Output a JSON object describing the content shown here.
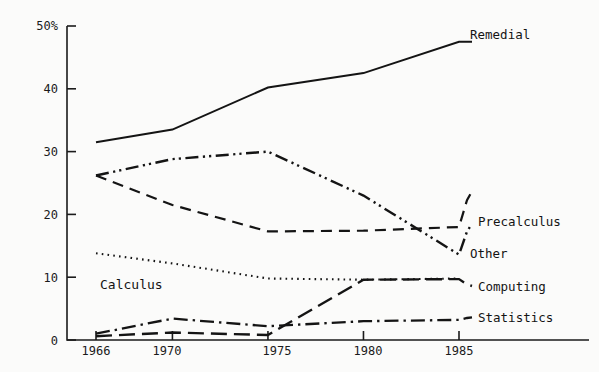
{
  "chart_data": {
    "type": "line",
    "title": "",
    "subtitle": "",
    "xlabel": "",
    "ylabel": "",
    "x": [
      1966,
      1970,
      1975,
      1980,
      1985
    ],
    "xtick_labels": [
      "1966",
      "1970",
      "1975",
      "1980",
      "1985"
    ],
    "ytick_labels": [
      "0",
      "10",
      "20",
      "30",
      "40",
      "50%"
    ],
    "ytick_values": [
      0,
      10,
      20,
      30,
      40,
      50
    ],
    "xlim": [
      1964.5,
      1986.5
    ],
    "ylim": [
      0,
      50
    ],
    "grid": false,
    "legend_position": "right-inline-labels",
    "series": [
      {
        "name": "Remedial",
        "label": "Remedial",
        "style": "solid",
        "values": [
          31.5,
          33.5,
          40.2,
          42.5,
          47.5
        ],
        "label_x": 1986.2,
        "label_y": 47.5
      },
      {
        "name": "Other",
        "label": "Other",
        "style": "dash-dot-dot",
        "values": [
          26.2,
          28.8,
          30.0,
          23.0,
          13.6
        ],
        "label_x": 1986.2,
        "label_y": 18.5
      },
      {
        "name": "Precalculus",
        "label": "Precalculus",
        "style": "dashed",
        "values": [
          26.2,
          21.5,
          17.3,
          17.4,
          18.0
        ],
        "label_x": 1986.2,
        "label_y": 23.7
      },
      {
        "name": "Calculus",
        "label": "Calculus",
        "style": "dotted",
        "values": [
          13.8,
          12.2,
          9.8,
          9.6,
          9.8
        ],
        "label_x": 1967.0,
        "label_y": 11.2
      },
      {
        "name": "Computing",
        "label": "Computing",
        "style": "long-dash",
        "values": [
          0.6,
          1.2,
          0.8,
          9.6,
          9.7
        ],
        "label_x": 1986.2,
        "label_y": 8.6
      },
      {
        "name": "Statistics",
        "label": "Statistics",
        "style": "dash-dot",
        "values": [
          1.0,
          3.4,
          2.2,
          3.0,
          3.2
        ],
        "label_x": 1986.2,
        "label_y": 3.6
      }
    ]
  },
  "axes": {
    "y_top_label": "50%",
    "y_labels": [
      "50%",
      "40",
      "30",
      "20",
      "10",
      "0"
    ],
    "x_labels": [
      "1966",
      "1970",
      "1975",
      "1980",
      "1985"
    ]
  },
  "labels": {
    "remedial": "Remedial",
    "precalculus": "Precalculus",
    "other": "Other",
    "computing": "Computing",
    "statistics": "Statistics",
    "calculus": "Calculus"
  }
}
